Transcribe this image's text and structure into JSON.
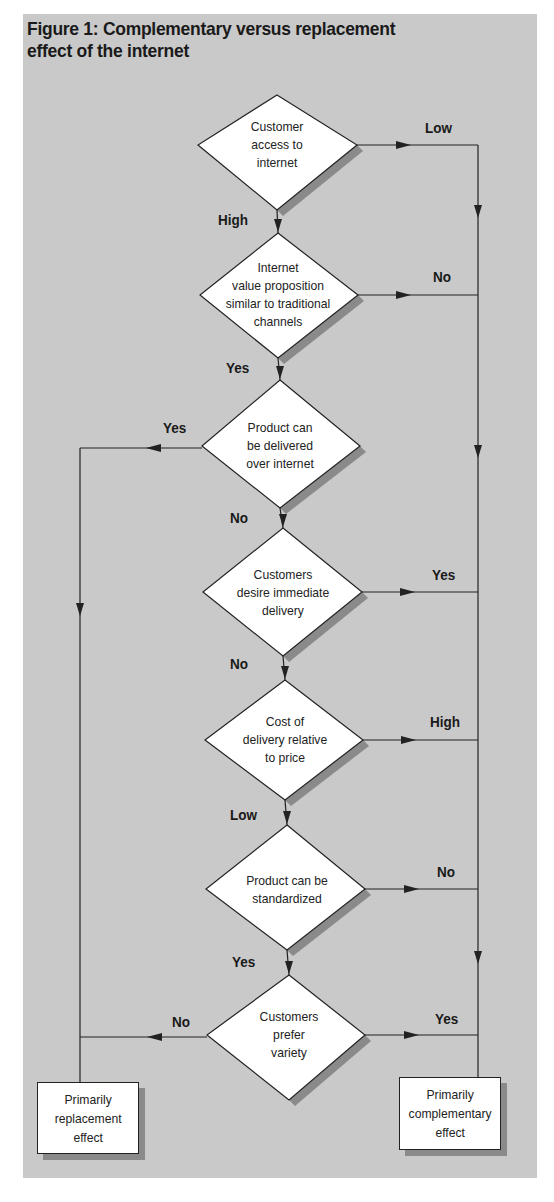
{
  "figure": {
    "title": "Figure 1: Complementary versus replacement effect of the internet",
    "title_line1": "Figure 1: Complementary versus replacement",
    "title_line2": "effect of the internet"
  },
  "colors": {
    "panel_bg": "#c9c9c9",
    "node_fill": "#ffffff",
    "line": "#222222",
    "shadow": "#8a8a8a"
  },
  "decisions": [
    {
      "id": "d1",
      "lines": [
        "Customer",
        "access to",
        "internet"
      ],
      "down_label": "High",
      "side_label": "Low",
      "side": "right"
    },
    {
      "id": "d2",
      "lines": [
        "Internet",
        "value proposition",
        "similar to traditional",
        "channels"
      ],
      "down_label": "Yes",
      "side_label": "No",
      "side": "right"
    },
    {
      "id": "d3",
      "lines": [
        "Product can",
        "be delivered",
        "over internet"
      ],
      "down_label": "No",
      "side_label": "Yes",
      "side": "left"
    },
    {
      "id": "d4",
      "lines": [
        "Customers",
        "desire immediate",
        "delivery"
      ],
      "down_label": "No",
      "side_label": "Yes",
      "side": "right"
    },
    {
      "id": "d5",
      "lines": [
        "Cost of",
        "delivery relative",
        "to  price"
      ],
      "down_label": "Low",
      "side_label": "High",
      "side": "right"
    },
    {
      "id": "d6",
      "lines": [
        "Product can be",
        "standardized"
      ],
      "down_label": "Yes",
      "side_label": "No",
      "side": "right"
    },
    {
      "id": "d7",
      "lines": [
        "Customers",
        "prefer",
        "variety"
      ],
      "left_label": "No",
      "right_label": "Yes"
    }
  ],
  "outcomes": {
    "replacement": {
      "lines": [
        "Primarily",
        "replacement",
        "effect"
      ]
    },
    "complementary": {
      "lines": [
        "Primarily",
        "complementary",
        "effect"
      ]
    }
  },
  "labels": {
    "d1_low": "Low",
    "d1_high": "High",
    "d2_no": "No",
    "d2_yes": "Yes",
    "d3_yes": "Yes",
    "d3_no": "No",
    "d4_yes": "Yes",
    "d4_no": "No",
    "d5_high": "High",
    "d5_low": "Low",
    "d6_no": "No",
    "d6_yes": "Yes",
    "d7_no": "No",
    "d7_yes": "Yes"
  },
  "text": {
    "d1": [
      "Customer",
      "access to",
      "internet"
    ],
    "d2": [
      "Internet",
      "value proposition",
      "similar to traditional",
      "channels"
    ],
    "d3": [
      "Product can",
      "be delivered",
      "over internet"
    ],
    "d4": [
      "Customers",
      "desire immediate",
      "delivery"
    ],
    "d5": [
      "Cost of",
      "delivery relative",
      "to  price"
    ],
    "d6": [
      "Product can be",
      "standardized"
    ],
    "d7": [
      "Customers",
      "prefer",
      "variety"
    ],
    "replacement": [
      "Primarily",
      "replacement",
      "effect"
    ],
    "complementary": [
      "Primarily",
      "complementary",
      "effect"
    ]
  }
}
